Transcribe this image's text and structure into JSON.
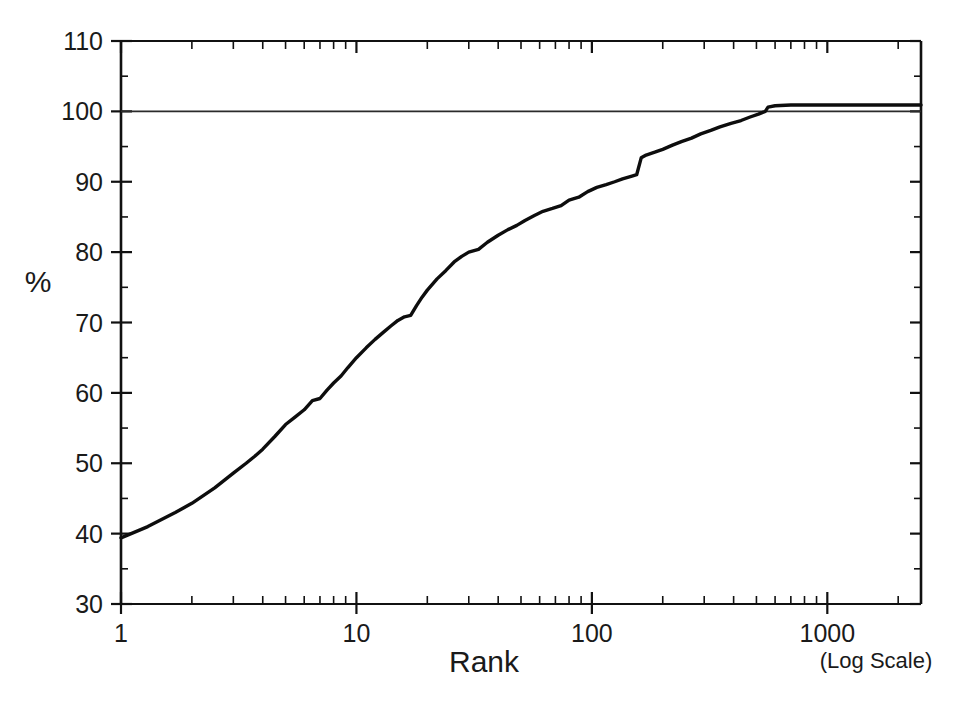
{
  "figure": {
    "background_color": "#ffffff",
    "line_color": "#0d0d0d",
    "axis_color": "#111111"
  },
  "labels": {
    "y_axis_title": "%",
    "x_axis_title": "Rank",
    "x_axis_note": "(Log Scale)",
    "y_ticks": [
      "110",
      "100",
      "90",
      "80",
      "70",
      "60",
      "50",
      "40",
      "30"
    ],
    "x_ticks": [
      "1",
      "10",
      "100",
      "1000"
    ]
  },
  "chart_data": {
    "type": "line",
    "title": "",
    "subtitle": "",
    "xlabel": "Rank",
    "ylabel": "%",
    "xlabel_note": "(Log Scale)",
    "xscale": "log",
    "yscale": "linear",
    "xlim": [
      1,
      2500
    ],
    "ylim": [
      30,
      110
    ],
    "ytick_values": [
      110,
      100,
      90,
      80,
      70,
      60,
      50,
      40,
      30
    ],
    "ytick_minor_step": 5,
    "xtick_values": [
      1,
      10,
      100,
      1000
    ],
    "xtick_minor": "decade subdivisions 2-9",
    "grid": false,
    "legend": null,
    "annotations": [
      {
        "type": "horizontal-reference-line",
        "y": 100,
        "label": "100% cumulative reference line",
        "spans_full_width": true
      }
    ],
    "series": [
      {
        "name": "Cumulative percent by rank",
        "x": [
          1,
          1.3,
          1.7,
          2,
          2.5,
          3,
          3.4,
          3.7,
          4,
          4.5,
          5,
          5.5,
          6,
          6.5,
          7,
          7.5,
          8,
          8.6,
          9.2,
          10,
          11,
          12,
          13,
          14,
          15,
          16,
          17,
          18,
          19,
          20,
          22,
          24,
          26,
          28,
          30,
          33,
          36,
          40,
          44,
          48,
          52,
          57,
          62,
          68,
          74,
          80,
          88,
          96,
          105,
          115,
          125,
          135,
          148,
          155,
          162,
          170,
          185,
          200,
          220,
          240,
          265,
          290,
          320,
          350,
          390,
          430,
          470,
          510,
          545,
          560,
          600,
          700,
          850,
          1000,
          1300,
          1700,
          2100,
          2500
        ],
        "y": [
          39.4,
          41.0,
          43.0,
          44.3,
          46.5,
          48.6,
          50.0,
          51.0,
          52.0,
          53.8,
          55.5,
          56.6,
          57.6,
          58.9,
          59.2,
          60.4,
          61.4,
          62.4,
          63.6,
          65.0,
          66.4,
          67.6,
          68.6,
          69.5,
          70.3,
          70.8,
          71.0,
          72.4,
          73.6,
          74.6,
          76.2,
          77.4,
          78.6,
          79.4,
          80.0,
          80.4,
          81.4,
          82.4,
          83.2,
          83.8,
          84.5,
          85.2,
          85.8,
          86.2,
          86.6,
          87.4,
          87.8,
          88.6,
          89.2,
          89.6,
          90.0,
          90.4,
          90.8,
          91.0,
          93.4,
          93.8,
          94.2,
          94.6,
          95.2,
          95.7,
          96.2,
          96.8,
          97.3,
          97.8,
          98.3,
          98.7,
          99.2,
          99.6,
          100.0,
          100.6,
          100.8,
          100.9,
          100.9,
          100.9,
          100.9,
          100.9,
          100.9,
          100.9
        ]
      }
    ]
  }
}
